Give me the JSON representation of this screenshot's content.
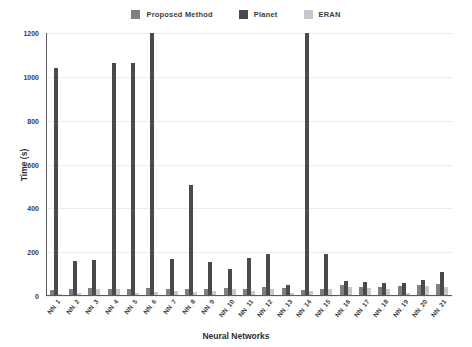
{
  "chart_data": {
    "type": "bar",
    "title": "",
    "xlabel": "Neural Networks",
    "ylabel": "Time (s)",
    "ylim": [
      0,
      1200
    ],
    "yticks": [
      0,
      200,
      400,
      600,
      800,
      1000,
      1200
    ],
    "grid": true,
    "legend_position": "top-center",
    "categories": [
      "NN_1",
      "NN_2",
      "NN_3",
      "NN_4",
      "NN_5",
      "NN_6",
      "NN_7",
      "NN_8",
      "NN_9",
      "NN_10",
      "NN_11",
      "NN_12",
      "NN_13",
      "NN_14",
      "NN_15",
      "NN_16",
      "NN_17",
      "NN_18",
      "NN_19",
      "NN_20",
      "NN_21"
    ],
    "series": [
      {
        "name": "Proposed Method",
        "color": "#808080",
        "values": [
          28,
          32,
          38,
          30,
          30,
          35,
          34,
          30,
          33,
          38,
          30,
          40,
          35,
          28,
          30,
          48,
          42,
          40,
          44,
          50,
          55
        ]
      },
      {
        "name": "Planet",
        "color": "#4a4a4a",
        "values": [
          1040,
          160,
          165,
          1065,
          1065,
          1200,
          170,
          505,
          155,
          125,
          175,
          190,
          52,
          1200,
          190,
          70,
          62,
          58,
          60,
          75,
          110
        ]
      },
      {
        "name": "ERAN",
        "color": "#c8c8c8",
        "values": [
          10,
          12,
          30,
          30,
          14,
          20,
          22,
          18,
          25,
          30,
          22,
          30,
          14,
          22,
          30,
          42,
          36,
          32,
          12,
          46,
          40
        ]
      }
    ]
  },
  "legend": {
    "items": [
      {
        "label": "Proposed Method"
      },
      {
        "label": "Planet"
      },
      {
        "label": "ERAN"
      }
    ]
  }
}
